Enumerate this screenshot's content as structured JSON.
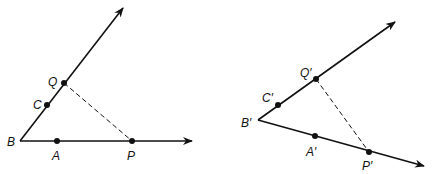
{
  "figures": [
    {
      "name": "original",
      "vertex": {
        "label": "B",
        "x": 20,
        "y": 141
      },
      "ray1_tip": {
        "x": 123,
        "y": 8
      },
      "ray2_tip": {
        "x": 192,
        "y": 141
      },
      "points": [
        {
          "label": "C",
          "x": 47,
          "y": 105,
          "lx": 33,
          "ly": 109
        },
        {
          "label": "Q",
          "x": 64,
          "y": 83,
          "lx": 48,
          "ly": 86
        },
        {
          "label": "A",
          "x": 57,
          "y": 141,
          "lx": 52,
          "ly": 160
        },
        {
          "label": "P",
          "x": 132,
          "y": 141,
          "lx": 127,
          "ly": 160
        }
      ],
      "vertex_label": {
        "text": "B",
        "x": 7,
        "y": 146
      },
      "dashed": {
        "from": "Q",
        "to": "P"
      }
    },
    {
      "name": "image",
      "vertex": {
        "label": "B′",
        "x": 258,
        "y": 120
      },
      "ray1_tip": {
        "x": 395,
        "y": 22
      },
      "ray2_tip": {
        "x": 424,
        "y": 166
      },
      "points": [
        {
          "label": "C′",
          "x": 278,
          "y": 105,
          "lx": 262,
          "ly": 102
        },
        {
          "label": "Q′",
          "x": 316,
          "y": 79,
          "lx": 300,
          "ly": 77
        },
        {
          "label": "A′",
          "x": 315,
          "y": 136,
          "lx": 306,
          "ly": 156
        },
        {
          "label": "P′",
          "x": 369,
          "y": 152,
          "lx": 362,
          "ly": 170
        }
      ],
      "vertex_label": {
        "text": "B′",
        "x": 241,
        "y": 127
      },
      "dashed": {
        "from": "Q′",
        "to": "P′"
      }
    }
  ],
  "colors": {
    "stroke": "#111111",
    "background": "#ffffff"
  }
}
